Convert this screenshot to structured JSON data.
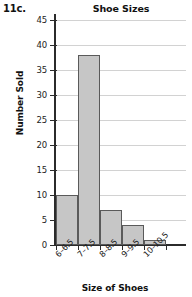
{
  "problem": {
    "label": "11c."
  },
  "chart_data": {
    "type": "bar",
    "title": "Shoe Sizes",
    "xlabel": "Size of Shoes",
    "ylabel": "Number Sold",
    "categories": [
      "6–6.5",
      "7–7.5",
      "8–8.5",
      "9–9.5",
      "10–10.5"
    ],
    "values": [
      10,
      38,
      7,
      4,
      1
    ],
    "ylim": [
      0,
      45
    ],
    "ytick_step": 5,
    "yticks": [
      0,
      5,
      10,
      15,
      20,
      25,
      30,
      35,
      40,
      45
    ],
    "ytick_labels": [
      "0",
      "5",
      "10",
      "15",
      "20",
      "25",
      "30",
      "35",
      "40",
      "45"
    ],
    "grid": true,
    "legend": false,
    "bar_fill_color": "#c6c6c6",
    "bar_edge_color": "#5a5a5a",
    "grid_color": "#d2d2d2",
    "axis_color": "#2b2b2b"
  }
}
